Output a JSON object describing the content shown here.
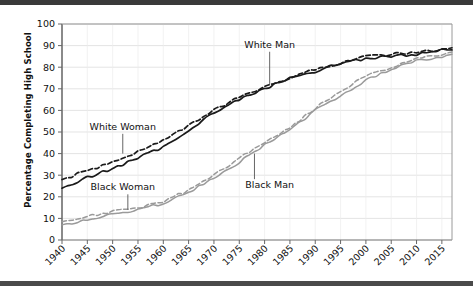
{
  "chart_data": {
    "type": "line",
    "title": "",
    "xlabel": "",
    "ylabel": "Percentage Completing High School",
    "xlim": [
      1940,
      2017
    ],
    "ylim": [
      0,
      100
    ],
    "grid": true,
    "legend_position": "inline-annotations",
    "x_ticks": [
      "1940",
      "1945",
      "1950",
      "1955",
      "1960",
      "1965",
      "1970",
      "1975",
      "1980",
      "1985",
      "1990",
      "1995",
      "2000",
      "2005",
      "2010",
      "2015"
    ],
    "y_ticks": [
      "0",
      "10",
      "20",
      "30",
      "40",
      "50",
      "60",
      "70",
      "80",
      "90",
      "100"
    ],
    "x": [
      1940,
      1945,
      1950,
      1955,
      1960,
      1965,
      1970,
      1975,
      1980,
      1985,
      1990,
      1995,
      2000,
      2005,
      2010,
      2015,
      2017
    ],
    "series": [
      {
        "name": "White Woman",
        "style": "dashed",
        "color": "#1a1a1a",
        "values": [
          28,
          32,
          36,
          41,
          46,
          53,
          60,
          66,
          71,
          75,
          79,
          82,
          85,
          86,
          87,
          88,
          89
        ]
      },
      {
        "name": "White Man",
        "style": "solid",
        "color": "#1a1a1a",
        "values": [
          24,
          29,
          33,
          38,
          43,
          51,
          59,
          65,
          70,
          75,
          78,
          82,
          84,
          85,
          86,
          88,
          88
        ]
      },
      {
        "name": "Black Woman",
        "style": "dashed",
        "color": "#9a9a9a",
        "values": [
          8.5,
          11,
          13,
          15,
          18,
          23,
          30,
          38,
          45,
          52,
          61,
          69,
          76,
          80,
          84,
          86,
          87
        ]
      },
      {
        "name": "Black Man",
        "style": "solid",
        "color": "#9a9a9a",
        "values": [
          7,
          9.5,
          12,
          14,
          17,
          22,
          29,
          36,
          44,
          51,
          60,
          67,
          74,
          79,
          83,
          85,
          86
        ]
      }
    ],
    "annotations": [
      {
        "label": "White Woman",
        "x": 1952,
        "y": 51,
        "leader_to_x": 1952,
        "leader_to_y": 40
      },
      {
        "label": "White Man",
        "x": 1981,
        "y": 89,
        "leader_to_x": 1981,
        "leader_to_y": 72
      },
      {
        "label": "Black Woman",
        "x": 1952,
        "y": 23,
        "leader_to_x": 1953,
        "leader_to_y": 14
      },
      {
        "label": "Black Man",
        "x": 1981,
        "y": 24,
        "leader_to_x": 1978,
        "leader_to_y": 40
      }
    ]
  },
  "axes": {
    "y_axis_title": "Percentage Completing High School"
  }
}
